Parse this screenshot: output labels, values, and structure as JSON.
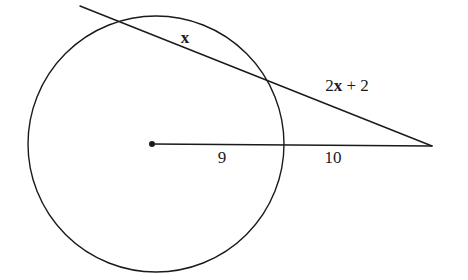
{
  "figure": {
    "type": "geometry-diagram",
    "background_color": "#ffffff",
    "stroke_color": "#1a1a1a",
    "text_color": "#1a1a1a"
  },
  "labels": {
    "secant_inner": "x",
    "secant_outer_prefix": "2",
    "secant_outer_var": "x",
    "secant_outer_suffix": " + 2",
    "secant_outer_full": "2x + 2",
    "radius": "9",
    "external": "10"
  },
  "geometry": {
    "circle": {
      "cx": 156,
      "cy": 144,
      "r": 128
    },
    "center_point": {
      "x": 152,
      "y": 144,
      "r": 3
    },
    "external_point": {
      "x": 432,
      "y": 146
    },
    "secant_start": {
      "x": 80,
      "y": 6
    },
    "horizontal_line": {
      "x1": 152,
      "y1": 144,
      "x2": 432,
      "y2": 146
    },
    "label_positions": {
      "secant_inner": {
        "x": 185,
        "y": 37
      },
      "secant_outer": {
        "x": 347,
        "y": 85
      },
      "radius": {
        "x": 222,
        "y": 157
      },
      "external": {
        "x": 333,
        "y": 157
      }
    }
  }
}
